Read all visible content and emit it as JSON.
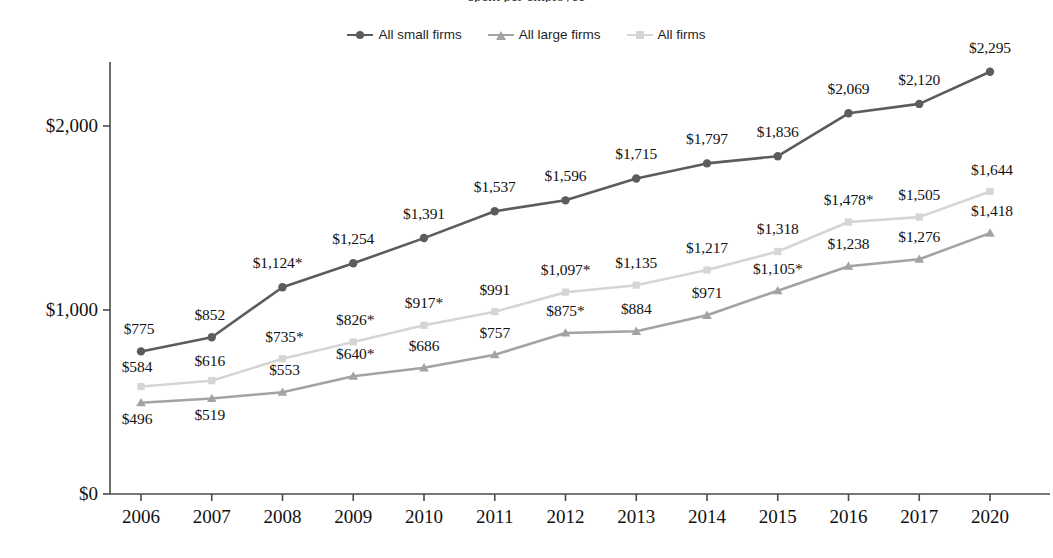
{
  "page": {
    "clipped_title_fragment": "spent per employee"
  },
  "chart_data": {
    "type": "line",
    "title": "",
    "xlabel": "",
    "ylabel": "",
    "categories": [
      "2006",
      "2007",
      "2008",
      "2009",
      "2010",
      "2011",
      "2012",
      "2013",
      "2014",
      "2015",
      "2016",
      "2017",
      "2020"
    ],
    "ylim": [
      0,
      2400
    ],
    "yticks": [
      0,
      1000,
      2000
    ],
    "ytick_labels": [
      "$0",
      "$1,000",
      "$2,000"
    ],
    "grid": false,
    "legend_position": "top-center",
    "series": [
      {
        "name": "All small firms",
        "color": "#5c5c5c",
        "marker": "circle",
        "values": [
          775,
          852,
          1124,
          1254,
          1391,
          1537,
          1596,
          1715,
          1797,
          1836,
          2069,
          2120,
          2295
        ],
        "labels": [
          "$775",
          "$852",
          "$1,124*",
          "$1,254",
          "$1,391",
          "$1,537",
          "$1,596",
          "$1,715",
          "$1,797",
          "$1,836",
          "$2,069",
          "$2,120",
          "$2,295"
        ]
      },
      {
        "name": "All large firms",
        "color": "#a3a3a3",
        "marker": "triangle",
        "values": [
          496,
          519,
          553,
          640,
          686,
          757,
          875,
          884,
          971,
          1105,
          1238,
          1276,
          1418
        ],
        "labels": [
          "$496",
          "$519",
          "$553",
          "$640*",
          "$686",
          "$757",
          "$875*",
          "$884",
          "$971",
          "$1,105*",
          "$1,238",
          "$1,276",
          "$1,418"
        ]
      },
      {
        "name": "All firms",
        "color": "#d5d5d5",
        "marker": "square",
        "values": [
          584,
          616,
          735,
          826,
          917,
          991,
          1097,
          1135,
          1217,
          1318,
          1478,
          1505,
          1644
        ],
        "labels": [
          "$584",
          "$616",
          "$735*",
          "$826*",
          "$917*",
          "$991",
          "$1,097*",
          "$1,135",
          "$1,217",
          "$1,318",
          "$1,478*",
          "$1,505",
          "$1,644"
        ]
      }
    ],
    "label_offsets": {
      "All small firms": [
        [
          -2,
          -22
        ],
        [
          -2,
          -22
        ],
        [
          -5,
          -24
        ],
        [
          0,
          -24
        ],
        [
          0,
          -24
        ],
        [
          0,
          -24
        ],
        [
          0,
          -24
        ],
        [
          0,
          -24
        ],
        [
          0,
          -24
        ],
        [
          0,
          -24
        ],
        [
          0,
          -24
        ],
        [
          0,
          -24
        ],
        [
          0,
          -24
        ]
      ],
      "All large firms": [
        [
          -4,
          16
        ],
        [
          -2,
          16
        ],
        [
          2,
          -22
        ],
        [
          2,
          -22
        ],
        [
          0,
          -22
        ],
        [
          0,
          -22
        ],
        [
          0,
          -22
        ],
        [
          0,
          -22
        ],
        [
          0,
          -22
        ],
        [
          0,
          -22
        ],
        [
          0,
          -22
        ],
        [
          0,
          -22
        ],
        [
          2,
          -22
        ]
      ],
      "All firms": [
        [
          -4,
          -20
        ],
        [
          -2,
          -20
        ],
        [
          2,
          -22
        ],
        [
          2,
          -22
        ],
        [
          0,
          -22
        ],
        [
          0,
          -22
        ],
        [
          0,
          -22
        ],
        [
          0,
          -22
        ],
        [
          0,
          -22
        ],
        [
          0,
          -22
        ],
        [
          0,
          -22
        ],
        [
          0,
          -22
        ],
        [
          2,
          -22
        ]
      ]
    }
  },
  "legend": {
    "items": [
      {
        "label": "All small firms",
        "color": "#5c5c5c",
        "marker": "circle"
      },
      {
        "label": "All large firms",
        "color": "#a3a3a3",
        "marker": "triangle"
      },
      {
        "label": "All firms",
        "color": "#d5d5d5",
        "marker": "square"
      }
    ]
  }
}
